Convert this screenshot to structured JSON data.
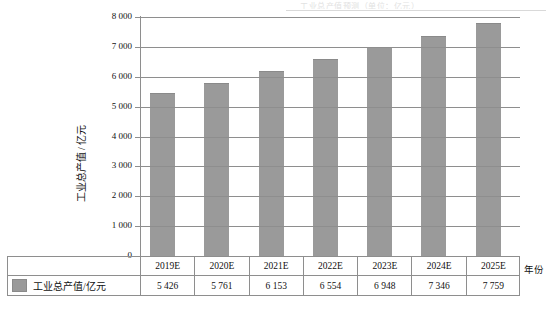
{
  "caption": {
    "top_faint_text": "工业总产值预测（单位：亿元）"
  },
  "axes": {
    "y_title": "工业总产值 / 亿元",
    "x_title": "年份",
    "y_ticks": [
      "0",
      "1 000",
      "2 000",
      "3 000",
      "4 000",
      "5 000",
      "6 000",
      "7 000",
      "8 000"
    ],
    "y_tick_values": [
      0,
      1000,
      2000,
      3000,
      4000,
      5000,
      6000,
      7000,
      8000
    ],
    "y_min": 0,
    "y_max": 8000
  },
  "legend": {
    "label": "工业总产值/亿元",
    "swatch_color": "#9a9a9a"
  },
  "table": {
    "year_row": [
      "2019E",
      "2020E",
      "2021E",
      "2022E",
      "2023E",
      "2024E",
      "2025E"
    ],
    "value_row": [
      "5 426",
      "5 761",
      "6 153",
      "6 554",
      "6 948",
      "7 346",
      "7 759"
    ]
  },
  "chart_data": {
    "type": "bar",
    "title": "",
    "xlabel": "年份",
    "ylabel": "工业总产值 / 亿元",
    "categories": [
      "2019E",
      "2020E",
      "2021E",
      "2022E",
      "2023E",
      "2024E",
      "2025E"
    ],
    "values": [
      5426,
      5761,
      6153,
      6554,
      6948,
      7346,
      7759
    ],
    "value_labels": [
      "5 426",
      "5 761",
      "6 153",
      "6 554",
      "6 948",
      "7 346",
      "7 759"
    ],
    "series": [
      {
        "name": "工业总产值/亿元",
        "values": [
          5426,
          5761,
          6153,
          6554,
          6948,
          7346,
          7759
        ],
        "color": "#9a9a9a"
      }
    ],
    "ylim": [
      0,
      8000
    ],
    "ytick_step": 1000,
    "grid": true,
    "grid_axis": "y",
    "legend_position": "bottom-table",
    "bar_color": "#9a9a9a",
    "gridline_color": "#8e8e8e",
    "data_table_shown": true
  }
}
